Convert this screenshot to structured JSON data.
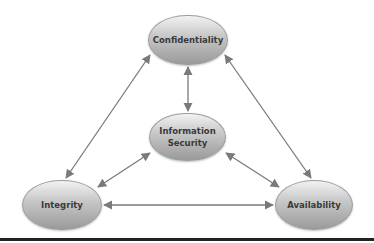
{
  "diagram": {
    "title": "",
    "nodes": {
      "confidentiality": {
        "label": "Confidentiality"
      },
      "information_security": {
        "line1": "Information",
        "line2": "Security"
      },
      "integrity": {
        "label": "Integrity"
      },
      "availability": {
        "label": "Availability"
      }
    },
    "edges": [
      {
        "from": "Confidentiality",
        "to": "Information Security",
        "type": "bidirectional"
      },
      {
        "from": "Confidentiality",
        "to": "Integrity",
        "type": "bidirectional"
      },
      {
        "from": "Confidentiality",
        "to": "Availability",
        "type": "bidirectional"
      },
      {
        "from": "Information Security",
        "to": "Integrity",
        "type": "bidirectional"
      },
      {
        "from": "Information Security",
        "to": "Availability",
        "type": "bidirectional"
      },
      {
        "from": "Integrity",
        "to": "Availability",
        "type": "bidirectional"
      }
    ],
    "colors": {
      "edge": "#7a7a7a",
      "node_top": "#f2f2f2",
      "node_bottom": "#9a9a9a",
      "text": "#3a3a3a",
      "rule": "#222222"
    }
  }
}
